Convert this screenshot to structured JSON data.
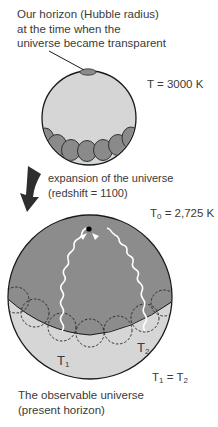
{
  "labels": {
    "horizon_line1": "Our horizon (Hubble radius)",
    "horizon_line2": "at the time when the",
    "horizon_line3": "universe became transparent",
    "temp_early": "T = 3000 K",
    "expansion_line1": "expansion of the universe",
    "expansion_line2": "(redshift = 1100)",
    "temp_now_prefix": "T",
    "temp_now_sub": "0",
    "temp_now_value": " = 2,725 K",
    "t1_label": "T",
    "t1_sub": "1",
    "t2_label": "T",
    "t2_sub": "2",
    "equality_t1": "T",
    "equality_t1_sub": "1",
    "equality_eq": " = ",
    "equality_t2": "T",
    "equality_t2_sub": "2",
    "observable_line1": "The observable universe",
    "observable_line2": "(present horizon)"
  },
  "colors": {
    "light_fill": "#d6d6d6",
    "dark_fill": "#8c8c8c",
    "outline": "#1a1a1a",
    "arrow": "#2e2e2e",
    "photon": "#ffffff"
  }
}
